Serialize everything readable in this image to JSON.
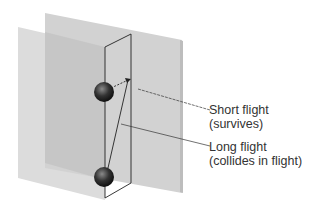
{
  "diagram": {
    "labels": [
      {
        "line1": "Short flight",
        "line2": "(survives)"
      },
      {
        "line1": "Long flight",
        "line2": "(collides in flight)"
      }
    ],
    "colors": {
      "back_plane": "#d4d4d4",
      "front_plane": "#dadada",
      "overlap": "#c4c4c4",
      "edge": "#222222",
      "text": "#333333"
    }
  }
}
